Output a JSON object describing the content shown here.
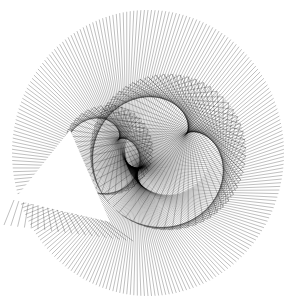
{
  "figure": {
    "title": "",
    "background": "#ffffff",
    "stroke_color": "#000000",
    "canvas": {
      "width": 289,
      "height": 301
    }
  },
  "string_art": {
    "outer_rim": {
      "cx": 148,
      "cy": 153,
      "rx": 136,
      "ry": 143,
      "points": 240,
      "stroke_opacity": 0.55,
      "stroke_width": 0.6
    },
    "radial_family": {
      "target": "cardioid",
      "multiplier": 2,
      "stroke_opacity": 0.5,
      "stroke_width": 0.5
    },
    "inner_circle": {
      "cx": 168,
      "cy": 152,
      "r": 78,
      "points": 120,
      "multiplier": 2,
      "stroke_opacity": 0.45,
      "stroke_width": 0.5
    },
    "inner_lobe": {
      "cx": 108,
      "cy": 150,
      "r": 45,
      "points": 80,
      "multiplier": 2,
      "stroke_opacity": 0.45,
      "stroke_width": 0.5
    },
    "triangle_cutout": {
      "points": [
        [
          70,
          130
        ],
        [
          14,
          200
        ],
        [
          110,
          222
        ]
      ],
      "fill": "#ffffff"
    },
    "triangle_hatch": {
      "from": [
        [
          14,
          200
        ],
        [
          110,
          222
        ]
      ],
      "count": 20,
      "stroke_opacity": 0.5
    }
  }
}
